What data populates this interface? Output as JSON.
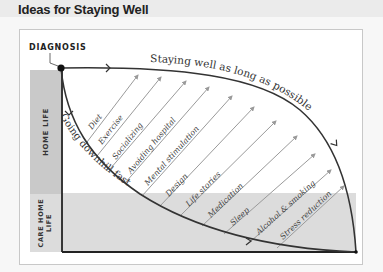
{
  "title": "Ideas for Staying Well",
  "diagram": {
    "start_label": "DIAGNOSIS",
    "upper_curve_label": "Staying well as long as possible",
    "lower_curve_label": "Going downhill fast",
    "bands": {
      "home": "HOME LIFE",
      "care_line1": "CARE HOME",
      "care_line2": "LIFE"
    },
    "arrows": [
      {
        "label": "Diet"
      },
      {
        "label": "Exercise"
      },
      {
        "label": "Socializing"
      },
      {
        "label": "Avoiding hospital"
      },
      {
        "label": "Mental stimulation"
      },
      {
        "label": "Design"
      },
      {
        "label": "Life stories"
      },
      {
        "label": "Medication"
      },
      {
        "label": "Sleep"
      },
      {
        "label": "Alcohol & smoking"
      },
      {
        "label": "Stress reduction"
      }
    ],
    "colors": {
      "home_band": "#c9c9c9",
      "care_band": "#dcdcdc",
      "curve": "#333333",
      "arrow": "#9a9a9a"
    }
  }
}
